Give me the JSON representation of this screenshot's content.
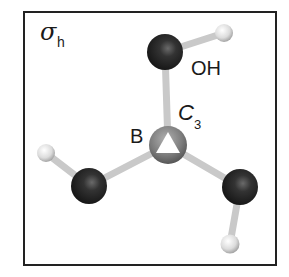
{
  "figure": {
    "symmetry_element_label": "σ",
    "symmetry_element_subscript": "h",
    "axis_label": "C",
    "axis_subscript": "3",
    "central_atom_label": "B",
    "group_label": "OH",
    "molecule": "B(OH)3"
  },
  "colors": {
    "frame": "#222222",
    "oxygen": "#2b2b2b",
    "hydrogen": "#d9d9d9",
    "boron": "#7a7a7a",
    "bond": "#cfcfcf",
    "axis_marker": "#ffffff"
  }
}
